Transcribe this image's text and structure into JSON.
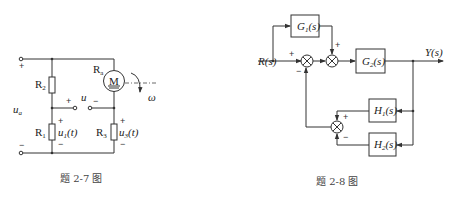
{
  "figures": [
    {
      "id": "fig-2-7",
      "caption": "题 2-7 图",
      "type": "circuit",
      "labels": {
        "source_voltage": "u",
        "source_voltage_sub": "a",
        "r1": "R",
        "r1_sub": "1",
        "r2": "R",
        "r2_sub": "2",
        "r3": "R",
        "r3_sub": "3",
        "ra": "R",
        "ra_sub": "a",
        "motor": "M",
        "u1": "u",
        "u1_sub": "1",
        "u1_arg": "(t)",
        "u3": "u",
        "u3_sub": "3",
        "u3_arg": "(t)",
        "u_mid": "u",
        "omega": "ω",
        "plus": "+",
        "minus": "−"
      }
    },
    {
      "id": "fig-2-8",
      "caption": "题 2-8 图",
      "type": "block-diagram",
      "input": "R(s)",
      "output": "Y(s)",
      "blocks": [
        {
          "name": "G1",
          "label": "G",
          "sub": "1",
          "arg": "(s)"
        },
        {
          "name": "G2",
          "label": "G",
          "sub": "2",
          "arg": "(s)"
        },
        {
          "name": "H1",
          "label": "H",
          "sub": "1",
          "arg": "(s)"
        },
        {
          "name": "H2",
          "label": "H",
          "sub": "2",
          "arg": "(s)"
        }
      ],
      "summing_junctions": [
        {
          "name": "sum1",
          "signs": [
            "+",
            "−"
          ]
        },
        {
          "name": "sum2",
          "signs": [
            "+"
          ]
        },
        {
          "name": "sum3",
          "signs": [
            "+",
            "−"
          ]
        }
      ],
      "plus": "+",
      "minus": "−"
    }
  ]
}
